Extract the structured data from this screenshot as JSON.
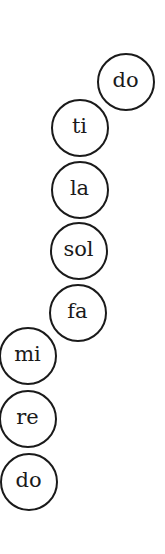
{
  "diagram": {
    "type": "solfege-scale",
    "notes": [
      {
        "label": "do",
        "cx": 126,
        "cy": 82
      },
      {
        "label": "ti",
        "cx": 80,
        "cy": 128
      },
      {
        "label": "la",
        "cx": 80,
        "cy": 190
      },
      {
        "label": "sol",
        "cx": 79,
        "cy": 251
      },
      {
        "label": "fa",
        "cx": 78,
        "cy": 313
      },
      {
        "label": "mi",
        "cx": 28,
        "cy": 356
      },
      {
        "label": "re",
        "cx": 28,
        "cy": 419
      },
      {
        "label": "do",
        "cx": 29,
        "cy": 482
      }
    ],
    "stroke_color": "#1a1a1a",
    "background": "#ffffff"
  }
}
